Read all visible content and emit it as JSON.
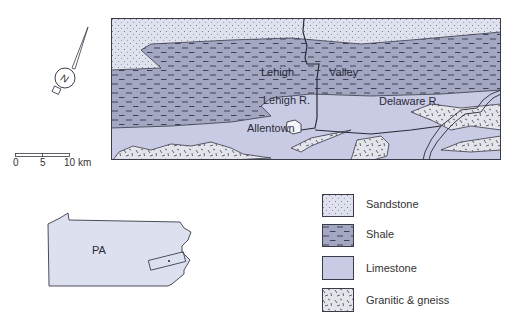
{
  "map": {
    "labels": {
      "lehigh": "Lehigh",
      "valley": "Valley",
      "lehigh_river": "Lehigh R.",
      "delaware_river": "Delaware R.",
      "allentown": "Allentown"
    }
  },
  "compass": {
    "letter": "N"
  },
  "scale_bar": {
    "ticks": [
      "0",
      "5",
      "10 km"
    ]
  },
  "inset": {
    "label": "PA"
  },
  "legend": {
    "items": [
      {
        "label": "Sandstone",
        "color": "#dfe2ee",
        "pattern": "dots"
      },
      {
        "label": "Shale",
        "color": "#a3a7c2",
        "pattern": "dashes"
      },
      {
        "label": "Limestone",
        "color": "#c8cbe3",
        "pattern": "none"
      },
      {
        "label": "Granitic & gneiss",
        "color": "#e4e5ea",
        "pattern": "ticks"
      }
    ]
  },
  "colors": {
    "sandstone": "#dfe2ee",
    "shale": "#a3a7c2",
    "limestone": "#c8cbe3",
    "granite": "#e4e5ea",
    "outline": "#3a3a48",
    "state": "#dde1ef"
  }
}
